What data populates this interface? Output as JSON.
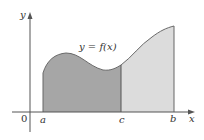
{
  "diagram": {
    "type": "area-under-curve",
    "curve_label": "y = f(x)",
    "axis": {
      "x_label": "x",
      "y_label": "y",
      "origin_label": "0"
    },
    "points": {
      "a": "a",
      "c": "c",
      "b": "b"
    },
    "regions": [
      {
        "name": "left-region",
        "from": "a",
        "to": "c",
        "color": "#a6a6a6"
      },
      {
        "name": "right-region",
        "from": "c",
        "to": "b",
        "color": "#dcdcdc"
      }
    ],
    "colors": {
      "axis": "#555555",
      "outline": "#666666",
      "text": "#333333"
    }
  }
}
